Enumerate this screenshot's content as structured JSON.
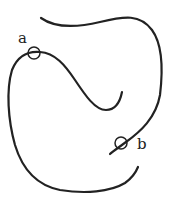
{
  "diagram": {
    "labels": {
      "a": "a",
      "b": "b"
    },
    "stroke_color": "#222222",
    "background": "#ffffff"
  }
}
